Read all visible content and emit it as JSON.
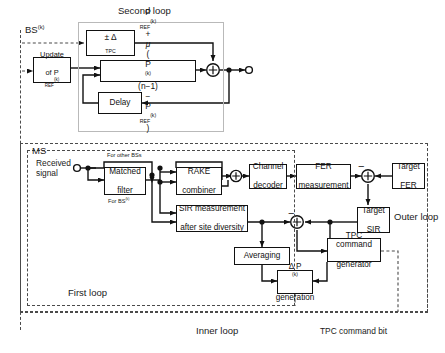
{
  "figure": {
    "title_labels": {
      "second_loop": "Second loop",
      "bs_k": "BS",
      "bs_k_sup": "(k)",
      "ms": "MS",
      "received_signal_line1": "Received",
      "received_signal_line2": "signal",
      "outer_loop": "Outer loop",
      "inner_loop": "Inner loop",
      "first_loop": "First loop",
      "tpc_command_bit": "TPC command bit",
      "for_other_bss": "For other  BSs",
      "for_bs_k": "For BS",
      "for_bs_k_sup": "(k)"
    },
    "bs_section": {
      "blocks": [
        {
          "id": "delta-tpc",
          "text": "± Δ",
          "subscript": "TPC"
        },
        {
          "id": "update-pref",
          "line1": "Update",
          "line2_prefix": "of  P",
          "line2_sub": "REF",
          "line2_sup": "(k)"
        },
        {
          "id": "pref-equation",
          "text": "P_REF^(k) + μ ( P^(k)(n−1) − P_REF^(k) )"
        },
        {
          "id": "delay",
          "text": "Delay"
        }
      ],
      "equation_parts": {
        "p1_base": "P",
        "p1_sub": "REF",
        "p1_sup": "(k)",
        "plus": "+",
        "mu": "μ",
        "open": "(",
        "p2_base": "P",
        "p2_sup": "(k)",
        "n_term": "(n−1)",
        "minus": "−",
        "p3_base": "P",
        "p3_sub": "REF",
        "p3_sup": "(k)",
        "close": ")"
      }
    },
    "ms_section": {
      "blocks": [
        {
          "id": "matched-filter",
          "line1": "Matched",
          "line2": "filter"
        },
        {
          "id": "rake-combiner",
          "line1": "RAKE",
          "line2": "combiner"
        },
        {
          "id": "channel-decoder",
          "line1": "Channel",
          "line2": "decoder"
        },
        {
          "id": "fer-measurement",
          "line1": "FER",
          "line2": "measurement"
        },
        {
          "id": "target-fer",
          "line1": "Target",
          "line2": "FER"
        },
        {
          "id": "sir-measurement",
          "line1": "SIR measurement",
          "line2": "after site diversity"
        },
        {
          "id": "target-sir",
          "line1": "Target",
          "line2": "SIR"
        },
        {
          "id": "averaging",
          "line1": "Averaging"
        },
        {
          "id": "tpc-command-generator",
          "line1": "TPC command",
          "line2": "generator"
        },
        {
          "id": "delta-p-generation",
          "line1_base": "Δ P",
          "line1_sup": "(k)",
          "line2": "generation"
        }
      ]
    },
    "symbols": {
      "summing_junction": "⊕",
      "minus_sign": "−",
      "open_terminal": "circle-open"
    },
    "colors": {
      "line": "#111111",
      "gray_frame": "#b9b9b9",
      "dash_frame": "#4a4a4a",
      "background": "#ffffff"
    }
  }
}
